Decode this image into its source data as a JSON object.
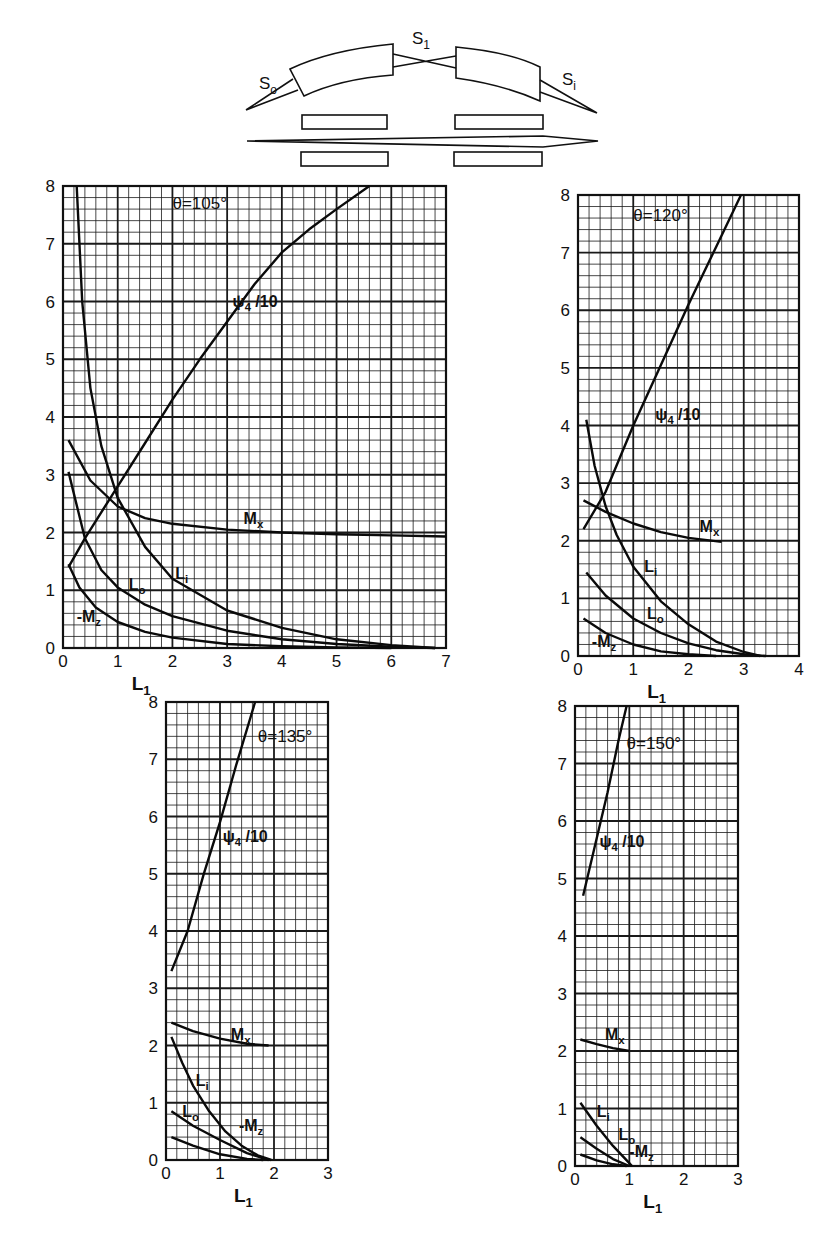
{
  "schematic": {
    "labels": {
      "source": "S",
      "source_sub": "o",
      "middle": "S",
      "middle_sub": "1",
      "image": "S",
      "image_sub": "i"
    }
  },
  "chart_data": [
    {
      "type": "line",
      "title": "θ=105°",
      "xlabel": "L1",
      "ylabel": "",
      "xlim": [
        0,
        7
      ],
      "ylim": [
        0,
        8
      ],
      "xticks": [
        "0",
        "1",
        "2",
        "3",
        "4",
        "5",
        "6",
        "7"
      ],
      "yticks": [
        "0",
        "1",
        "2",
        "3",
        "4",
        "5",
        "6",
        "7",
        "8"
      ],
      "grid": true,
      "minor_divisions": 5,
      "box": {
        "x0": 63,
        "y0": 186,
        "x1": 446,
        "y1": 648
      },
      "title_pos": [
        2.0,
        7.6
      ],
      "series": [
        {
          "name": "ψ4/10",
          "label_pos": [
            3.1,
            5.9
          ],
          "x": [
            0.1,
            0.4,
            1.0,
            1.5,
            2.0,
            2.5,
            3.0,
            3.5,
            4.0,
            4.5,
            5.0,
            5.6
          ],
          "y": [
            1.4,
            1.9,
            2.8,
            3.55,
            4.3,
            5.0,
            5.65,
            6.3,
            6.85,
            7.25,
            7.6,
            8.0
          ]
        },
        {
          "name": "L_i",
          "label_pos": [
            2.05,
            1.2
          ],
          "x": [
            0.25,
            0.35,
            0.5,
            0.7,
            1.0,
            1.5,
            2.0,
            3.0,
            4.0,
            5.0,
            6.0,
            6.8
          ],
          "y": [
            8.0,
            6.0,
            4.5,
            3.5,
            2.6,
            1.75,
            1.2,
            0.65,
            0.35,
            0.15,
            0.05,
            0.0
          ]
        },
        {
          "name": "Mx",
          "label_pos": [
            3.3,
            2.15
          ],
          "x": [
            0.1,
            0.5,
            1.0,
            1.5,
            2.0,
            3.0,
            4.0,
            5.0,
            6.0,
            7.0
          ],
          "y": [
            3.6,
            2.9,
            2.45,
            2.25,
            2.15,
            2.05,
            2.0,
            1.97,
            1.95,
            1.93
          ]
        },
        {
          "name": "L_o",
          "label_pos": [
            1.2,
            1.0
          ],
          "x": [
            0.1,
            0.4,
            0.7,
            1.0,
            1.5,
            2.0,
            3.0,
            4.0,
            5.0,
            6.0,
            6.8
          ],
          "y": [
            3.05,
            1.9,
            1.35,
            1.05,
            0.75,
            0.55,
            0.3,
            0.15,
            0.07,
            0.02,
            0.0
          ]
        },
        {
          "name": "-Mz",
          "label_pos": [
            0.25,
            0.45
          ],
          "x": [
            0.1,
            0.3,
            0.6,
            1.0,
            1.5,
            2.0,
            3.0,
            4.0,
            5.0,
            6.0
          ],
          "y": [
            1.45,
            1.05,
            0.7,
            0.45,
            0.28,
            0.18,
            0.07,
            0.03,
            0.01,
            0.0
          ]
        }
      ]
    },
    {
      "type": "line",
      "title": "θ=120°",
      "xlabel": "L1",
      "ylabel": "",
      "xlim": [
        0,
        4
      ],
      "ylim": [
        0,
        8
      ],
      "xticks": [
        "0",
        "1",
        "2",
        "3",
        "4"
      ],
      "yticks": [
        "0",
        "1",
        "2",
        "3",
        "4",
        "5",
        "6",
        "7",
        "8"
      ],
      "grid": true,
      "minor_divisions": 5,
      "box": {
        "x0": 578,
        "y0": 195,
        "x1": 799,
        "y1": 656
      },
      "title_pos": [
        1.0,
        7.55
      ],
      "series": [
        {
          "name": "ψ4/10",
          "label_pos": [
            1.4,
            4.1
          ],
          "x": [
            0.1,
            0.5,
            1.0,
            1.5,
            2.0,
            2.5,
            2.95
          ],
          "y": [
            2.2,
            2.85,
            4.0,
            5.05,
            6.1,
            7.1,
            8.0
          ]
        },
        {
          "name": "L_i",
          "label_pos": [
            1.2,
            1.45
          ],
          "x": [
            0.15,
            0.3,
            0.5,
            0.7,
            1.0,
            1.5,
            2.0,
            2.5,
            3.0,
            3.3
          ],
          "y": [
            4.1,
            3.3,
            2.6,
            2.1,
            1.55,
            0.95,
            0.55,
            0.25,
            0.07,
            0.0
          ]
        },
        {
          "name": "Mx",
          "label_pos": [
            2.2,
            2.15
          ],
          "x": [
            0.1,
            0.5,
            1.0,
            1.5,
            2.0,
            2.6
          ],
          "y": [
            2.7,
            2.5,
            2.3,
            2.15,
            2.05,
            1.98
          ]
        },
        {
          "name": "L_o",
          "label_pos": [
            1.25,
            0.65
          ],
          "x": [
            0.15,
            0.5,
            1.0,
            1.5,
            2.0,
            2.5,
            3.0,
            3.4
          ],
          "y": [
            1.45,
            1.05,
            0.65,
            0.4,
            0.22,
            0.1,
            0.03,
            0.0
          ]
        },
        {
          "name": "-Mz",
          "label_pos": [
            0.25,
            0.15
          ],
          "x": [
            0.1,
            0.5,
            1.0,
            1.5,
            2.0,
            2.5
          ],
          "y": [
            0.65,
            0.4,
            0.2,
            0.08,
            0.03,
            0.0
          ]
        }
      ]
    },
    {
      "type": "line",
      "title": "θ=135°",
      "xlabel": "L1",
      "ylabel": "",
      "xlim": [
        0,
        3
      ],
      "ylim": [
        0,
        8
      ],
      "xticks": [
        "0",
        "1",
        "2",
        "3"
      ],
      "yticks": [
        "0",
        "1",
        "2",
        "3",
        "4",
        "5",
        "6",
        "7",
        "8"
      ],
      "grid": true,
      "minor_divisions": 5,
      "box": {
        "x0": 166,
        "y0": 702,
        "x1": 328,
        "y1": 1160
      },
      "title_pos": [
        1.7,
        7.3
      ],
      "series": [
        {
          "name": "ψ4/10",
          "label_pos": [
            1.05,
            5.55
          ],
          "x": [
            0.1,
            0.4,
            0.7,
            1.0,
            1.3,
            1.65
          ],
          "y": [
            3.3,
            4.0,
            5.0,
            5.9,
            6.9,
            8.0
          ]
        },
        {
          "name": "L_i",
          "label_pos": [
            0.55,
            1.3
          ],
          "x": [
            0.1,
            0.3,
            0.5,
            0.8,
            1.1,
            1.4,
            1.7,
            1.95
          ],
          "y": [
            2.15,
            1.7,
            1.3,
            0.85,
            0.5,
            0.25,
            0.08,
            0.0
          ]
        },
        {
          "name": "Mx",
          "label_pos": [
            1.2,
            2.1
          ],
          "x": [
            0.1,
            0.5,
            1.0,
            1.5,
            1.9
          ],
          "y": [
            2.4,
            2.25,
            2.12,
            2.03,
            2.0
          ]
        },
        {
          "name": "L_o",
          "label_pos": [
            0.3,
            0.75
          ],
          "x": [
            0.1,
            0.5,
            1.0,
            1.5,
            1.9
          ],
          "y": [
            0.85,
            0.6,
            0.35,
            0.12,
            0.0
          ]
        },
        {
          "name": "-Mz",
          "label_pos": [
            1.35,
            0.5
          ],
          "x": [
            0.1,
            0.5,
            1.0,
            1.5,
            1.8
          ],
          "y": [
            0.4,
            0.25,
            0.1,
            0.02,
            0.0
          ]
        }
      ]
    },
    {
      "type": "line",
      "title": "θ=150°",
      "xlabel": "L1",
      "ylabel": "",
      "xlim": [
        0,
        3
      ],
      "ylim": [
        0,
        8
      ],
      "xticks": [
        "0",
        "1",
        "2",
        "3"
      ],
      "yticks": [
        "0",
        "1",
        "2",
        "3",
        "4",
        "5",
        "6",
        "7",
        "8"
      ],
      "grid": true,
      "minor_divisions": 5,
      "box": {
        "x0": 575,
        "y0": 706,
        "x1": 738,
        "y1": 1166
      },
      "title_pos": [
        0.95,
        7.25
      ],
      "series": [
        {
          "name": "ψ4/10",
          "label_pos": [
            0.45,
            5.55
          ],
          "x": [
            0.15,
            0.35,
            0.6,
            0.8,
            0.95
          ],
          "y": [
            4.7,
            5.5,
            6.5,
            7.4,
            8.0
          ]
        },
        {
          "name": "L_i",
          "label_pos": [
            0.4,
            0.85
          ],
          "x": [
            0.1,
            0.4,
            0.7,
            1.0,
            1.05
          ],
          "y": [
            1.1,
            0.7,
            0.35,
            0.05,
            0.0
          ]
        },
        {
          "name": "Mx",
          "label_pos": [
            0.55,
            2.2
          ],
          "x": [
            0.1,
            0.4,
            0.7,
            1.0
          ],
          "y": [
            2.2,
            2.12,
            2.05,
            2.0
          ]
        },
        {
          "name": "L_o",
          "label_pos": [
            0.8,
            0.45
          ],
          "x": [
            0.1,
            0.4,
            0.7,
            1.0
          ],
          "y": [
            0.5,
            0.3,
            0.12,
            0.0
          ]
        },
        {
          "name": "-Mz",
          "label_pos": [
            1.0,
            0.15
          ],
          "x": [
            0.1,
            0.4,
            0.7,
            0.95
          ],
          "y": [
            0.2,
            0.1,
            0.03,
            0.0
          ]
        }
      ]
    }
  ]
}
